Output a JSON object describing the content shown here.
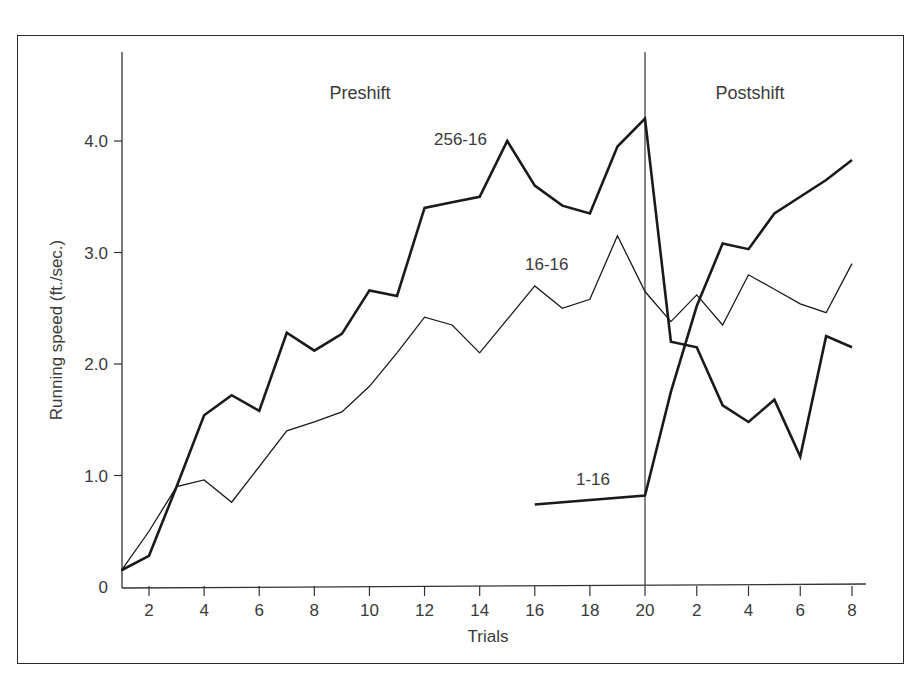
{
  "chart_data": {
    "type": "line",
    "title": "",
    "xlabel": "Trials",
    "ylabel": "Running speed (ft./sec.)",
    "ylim": [
      0,
      4.5
    ],
    "yticks": [
      0,
      1.0,
      2.0,
      3.0,
      4.0
    ],
    "ytick_labels": [
      "0",
      "1.0",
      "2.0",
      "3.0",
      "4.0"
    ],
    "xtick_labels": [
      "2",
      "4",
      "6",
      "8",
      "10",
      "12",
      "14",
      "16",
      "18",
      "20",
      "2",
      "4",
      "6",
      "8"
    ],
    "regions": [
      {
        "label": "Preshift",
        "trials": [
          1,
          20
        ]
      },
      {
        "label": "Postshift",
        "trials": [
          1,
          8
        ]
      }
    ],
    "grid": false,
    "legend": "inline labels",
    "series": [
      {
        "name": "256-16",
        "style": "thick",
        "preshift": {
          "trials": [
            1,
            2,
            3,
            4,
            5,
            6,
            7,
            8,
            9,
            10,
            11,
            12,
            13,
            14,
            15,
            16,
            17,
            18,
            19,
            20
          ],
          "values": [
            0.15,
            0.28,
            0.9,
            1.54,
            1.72,
            1.58,
            2.28,
            2.12,
            2.27,
            2.66,
            2.61,
            3.4,
            3.45,
            3.5,
            4.0,
            3.6,
            3.42,
            3.35,
            3.95,
            4.2
          ]
        },
        "postshift": {
          "trials": [
            1,
            2,
            3,
            4,
            5,
            6,
            7,
            8
          ],
          "values": [
            2.2,
            2.15,
            1.63,
            1.48,
            1.68,
            1.17,
            2.25,
            2.15
          ]
        }
      },
      {
        "name": "16-16",
        "style": "thin",
        "preshift": {
          "trials": [
            1,
            2,
            3,
            4,
            5,
            6,
            7,
            8,
            9,
            10,
            11,
            12,
            13,
            14,
            15,
            16,
            17,
            18,
            19,
            20
          ],
          "values": [
            0.15,
            0.5,
            0.9,
            0.96,
            0.76,
            1.08,
            1.4,
            1.48,
            1.57,
            1.8,
            2.1,
            2.42,
            2.35,
            2.1,
            2.4,
            2.7,
            2.5,
            2.58,
            3.15,
            2.65
          ]
        },
        "postshift": {
          "trials": [
            1,
            2,
            3,
            4,
            5,
            6,
            7,
            8
          ],
          "values": [
            2.38,
            2.62,
            2.35,
            2.8,
            2.67,
            2.54,
            2.46,
            2.9
          ]
        }
      },
      {
        "name": "1-16",
        "style": "thick",
        "preshift": {
          "trials": [
            16,
            20
          ],
          "values": [
            0.74,
            0.82
          ]
        },
        "postshift": {
          "trials": [
            1,
            2,
            3,
            4,
            5,
            6,
            7,
            8
          ],
          "values": [
            1.75,
            2.52,
            3.08,
            3.03,
            3.35,
            3.5,
            3.65,
            3.83
          ]
        }
      }
    ]
  },
  "labels": {
    "preshift": "Preshift",
    "postshift": "Postshift",
    "xlabel": "Trials",
    "ylabel": "Running speed (ft./sec.)",
    "series_256": "256-16",
    "series_16": "16-16",
    "series_1": "1-16"
  }
}
